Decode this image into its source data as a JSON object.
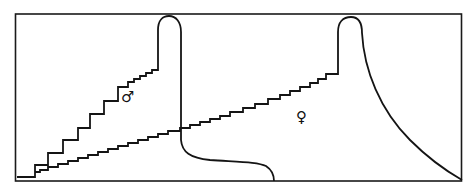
{
  "diagram": {
    "type": "line-diagram",
    "colors": {
      "line": "#141414",
      "background": "#ffffff"
    },
    "labels": {
      "male": "♂",
      "female": "♀"
    },
    "series": [
      {
        "name": "male",
        "symbol": "♂",
        "shape": "steep staircase rise, narrow rounded peak, sharp drop to low plateau, then falls to baseline",
        "points": [
          [
            17,
            177
          ],
          [
            35,
            177
          ],
          [
            35,
            165
          ],
          [
            48,
            165
          ],
          [
            48,
            153
          ],
          [
            63,
            153
          ],
          [
            63,
            140
          ],
          [
            78,
            140
          ],
          [
            78,
            128
          ],
          [
            90,
            128
          ],
          [
            90,
            114
          ],
          [
            104,
            114
          ],
          [
            104,
            101
          ],
          [
            118,
            101
          ],
          [
            118,
            87
          ],
          [
            128,
            87
          ],
          [
            128,
            82
          ],
          [
            134,
            82
          ],
          [
            134,
            79
          ],
          [
            140,
            79
          ],
          [
            140,
            76
          ],
          [
            146,
            76
          ],
          [
            146,
            73
          ],
          [
            152,
            73
          ],
          [
            152,
            70
          ],
          [
            158,
            70
          ]
        ]
      },
      {
        "name": "female",
        "symbol": "♀",
        "shape": "shallow staircase rise, rounded peak, gradual concave decline to baseline",
        "points": [
          [
            35,
            177
          ],
          [
            35,
            172
          ],
          [
            40,
            172
          ],
          [
            40,
            170
          ],
          [
            48,
            170
          ],
          [
            48,
            167
          ],
          [
            58,
            167
          ],
          [
            58,
            164
          ],
          [
            68,
            164
          ],
          [
            68,
            161
          ],
          [
            78,
            161
          ],
          [
            78,
            158
          ],
          [
            88,
            158
          ],
          [
            88,
            155
          ],
          [
            98,
            155
          ],
          [
            98,
            152
          ],
          [
            108,
            152
          ],
          [
            108,
            149
          ],
          [
            118,
            149
          ],
          [
            118,
            146
          ],
          [
            128,
            146
          ],
          [
            128,
            143
          ],
          [
            138,
            143
          ],
          [
            138,
            140
          ],
          [
            148,
            140
          ],
          [
            148,
            137
          ],
          [
            158,
            137
          ],
          [
            158,
            134
          ],
          [
            168,
            134
          ],
          [
            168,
            131
          ],
          [
            180,
            131
          ],
          [
            180,
            128
          ],
          [
            190,
            128
          ],
          [
            190,
            125
          ],
          [
            200,
            125
          ],
          [
            200,
            122
          ],
          [
            210,
            122
          ],
          [
            210,
            119
          ],
          [
            220,
            119
          ],
          [
            220,
            116
          ],
          [
            230,
            116
          ],
          [
            230,
            112
          ],
          [
            243,
            112
          ],
          [
            243,
            108
          ],
          [
            255,
            108
          ],
          [
            255,
            104
          ],
          [
            268,
            104
          ],
          [
            268,
            99
          ],
          [
            280,
            99
          ],
          [
            280,
            95
          ],
          [
            290,
            95
          ],
          [
            290,
            91
          ],
          [
            300,
            91
          ],
          [
            300,
            87
          ],
          [
            310,
            87
          ],
          [
            310,
            83
          ],
          [
            318,
            83
          ],
          [
            318,
            79
          ],
          [
            326,
            79
          ],
          [
            326,
            74
          ],
          [
            338,
            74
          ]
        ]
      }
    ]
  }
}
